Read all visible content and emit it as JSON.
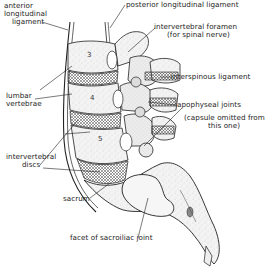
{
  "diagram": {
    "type": "anatomical-illustration",
    "labels": {
      "anterior_longitudinal_ligament": [
        "anterior",
        "longitudinal",
        "ligament"
      ],
      "posterior_longitudinal_ligament": "posterior longitudinal ligament",
      "intervertebral_foramen": [
        "intervertebral foramen",
        "(for spinal nerve)"
      ],
      "interspinous_ligament": "interspinous ligament",
      "lumbar_vertebrae": [
        "lumbar",
        "vertebrae"
      ],
      "apophyseal_joints": "apophyseal joints",
      "capsule_note": [
        "(capsule omitted from",
        "this one)"
      ],
      "intervertebral_discs": [
        "intervertebral",
        "discs"
      ],
      "sacrum": "sacrum",
      "facet_sacroiliac": "facet of sacroiliac joint"
    },
    "vertebra_numbers": [
      "3",
      "4",
      "5"
    ]
  }
}
